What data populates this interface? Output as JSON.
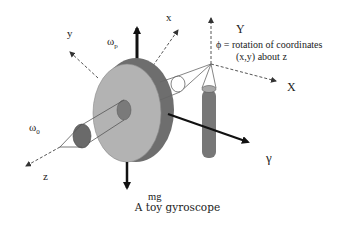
{
  "caption": "A toy gyroscope",
  "labels": {
    "x_body": "x",
    "y_body": "y",
    "z_body": "z",
    "omega_p": "ω",
    "omega_p_sub": "p",
    "omega_0": "ω",
    "omega_0_sub": "0",
    "Y_space": "Y",
    "X_space": "X",
    "gamma": "γ",
    "mg": "mg",
    "phi_line1": "ϕ = rotation of coordinates",
    "phi_line2": "(x,y) about z"
  },
  "colors": {
    "disk_face": "#b3b3b3",
    "disk_rim": "#6e6e6e",
    "hub": "#7a7a7a",
    "pillar": "#777777",
    "pillar_top": "#a8a8a8",
    "arrow": "#111111",
    "dashed": "#555555"
  }
}
